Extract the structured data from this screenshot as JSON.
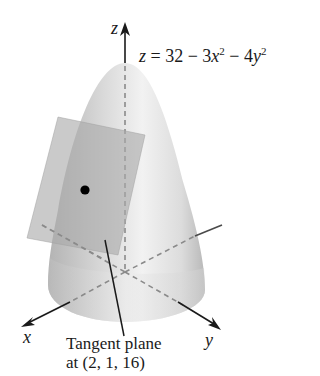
{
  "figure": {
    "type": "3d-surface-diagram",
    "surface": {
      "name": "elliptic paraboloid",
      "equation_lhs": "z",
      "equation_rhs_parts": [
        "32 − 3",
        "x",
        "2",
        " − 4",
        "y",
        "2"
      ],
      "equation_text": "z = 32 − 3x² − 4y²"
    },
    "axes": {
      "x_label": "x",
      "y_label": "y",
      "z_label": "z"
    },
    "tangent_plane": {
      "label_line1": "Tangent plane",
      "label_line2": "at (2, 1, 16)",
      "point": "(2, 1, 16)"
    },
    "colors": {
      "surface_light": "#efefef",
      "surface_dark": "#a8a8a8",
      "plane_fill": "#b9b9b9",
      "axis": "#2a2a2a",
      "dashed_axis": "#8a8a8a",
      "point": "#000000"
    }
  }
}
